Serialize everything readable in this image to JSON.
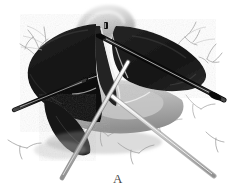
{
  "figure": {
    "caption_label": "A",
    "style": "grayscale halftone medical illustration",
    "background_color": "#ffffff",
    "ink_color": "#1a1a1a",
    "midtone_color": "#8d8d8d",
    "lighttone_color": "#c9c9c9",
    "line_color": "#5b5b5b"
  },
  "anatomy": {
    "organ_mass_label": "liver-lobe-mass",
    "organ_mass_color": "#1b1b1b",
    "organ_edge_color": "#3a3a3a",
    "left_lobe_label": "left-lobe",
    "right_lobe_label": "right-lobe",
    "cleft_label": "hilar-cleft",
    "retracted_tissue_label": "retracted-tissue",
    "retracted_tissue_color": "#d2d2d2",
    "pale_tissue_label": "pale-tissue-bed",
    "pale_tissue_color": "#b9b9b9",
    "shadow_color": "#6f6f6f"
  },
  "instruments": [
    {
      "name": "grasper-upper-right",
      "description": "long dark instrument shaft entering from upper right",
      "color": "#151515",
      "highlight": "#f2f2f2"
    },
    {
      "name": "dissector-left",
      "description": "pointed instrument tip entering from left",
      "color": "#101010",
      "highlight": "#ededed"
    },
    {
      "name": "retractor-lower-right",
      "description": "pale shaft crossing toward lower right",
      "color": "#a8a8a8",
      "highlight": "#ffffff"
    },
    {
      "name": "probe-center",
      "description": "slim shaft descending through center to lower left",
      "color": "#8a8a8a",
      "highlight": "#f6f6f6"
    }
  ],
  "vasculature": {
    "label": "line-drawn-vessels",
    "color": "#585858",
    "note": "fine branching vessel outlines on white field"
  }
}
